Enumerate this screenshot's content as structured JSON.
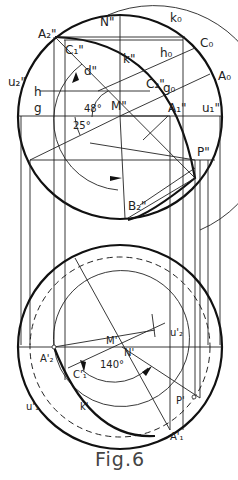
{
  "figure": {
    "caption": "Fig.6",
    "top_view_labels": {
      "A2": "A₂\"",
      "C1": "C₁\"",
      "N": "N\"",
      "k0": "k₀",
      "C0": "C₀",
      "h0": "h₀",
      "k": "k\"",
      "d": "d\"",
      "u2": "u₂\"",
      "C2": "C₂\"",
      "g0": "g₀",
      "A0": "A₀",
      "h": "h",
      "g": "g",
      "angle48": "48°",
      "M": "M\"",
      "A1": "A₁\"",
      "u1": "u₁\"",
      "angle25": "25°",
      "P": "P\"",
      "B2": "B₂\""
    },
    "bottom_view_labels": {
      "M": "M'",
      "N": "N'",
      "u2": "u'₂",
      "A2": "A'₂",
      "angle140": "140°",
      "C1": "C'₁",
      "u1": "u'₁",
      "k": "k'",
      "P": "P'",
      "A1": "A'₁"
    }
  }
}
